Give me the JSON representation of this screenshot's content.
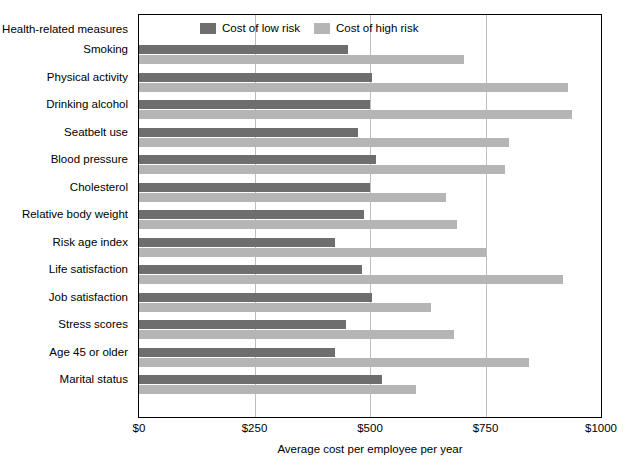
{
  "chart_data": {
    "type": "bar",
    "orientation": "horizontal",
    "title": "",
    "header_label": "Health-related measures",
    "xlabel": "Average cost per employee per year",
    "ylabel": "",
    "xlim": [
      0,
      1000
    ],
    "xticks": [
      0,
      250,
      500,
      750,
      1000
    ],
    "xtick_labels": [
      "$0",
      "$250",
      "$500",
      "$750",
      "$1000"
    ],
    "grid": true,
    "grid_axis": "x",
    "legend_position": "top-center",
    "categories": [
      "Smoking",
      "Physical activity",
      "Drinking alcohol",
      "Seatbelt use",
      "Blood pressure",
      "Cholesterol",
      "Relative body weight",
      "Risk age index",
      "Life satisfaction",
      "Job satisfaction",
      "Stress scores",
      "Age 45 or older",
      "Marital status"
    ],
    "series": [
      {
        "name": "Cost of low risk",
        "color": "#6e6e6e",
        "values": [
          453,
          505,
          500,
          475,
          512,
          500,
          488,
          425,
          482,
          505,
          448,
          425,
          525
        ]
      },
      {
        "name": "Cost of high risk",
        "color": "#b5b5b5",
        "values": [
          703,
          928,
          938,
          800,
          792,
          665,
          688,
          750,
          918,
          632,
          682,
          845,
          600
        ]
      }
    ]
  },
  "legend": {
    "entries": [
      {
        "label": "Cost of low risk",
        "color": "#6e6e6e"
      },
      {
        "label": "Cost of high risk",
        "color": "#b5b5b5"
      }
    ]
  }
}
